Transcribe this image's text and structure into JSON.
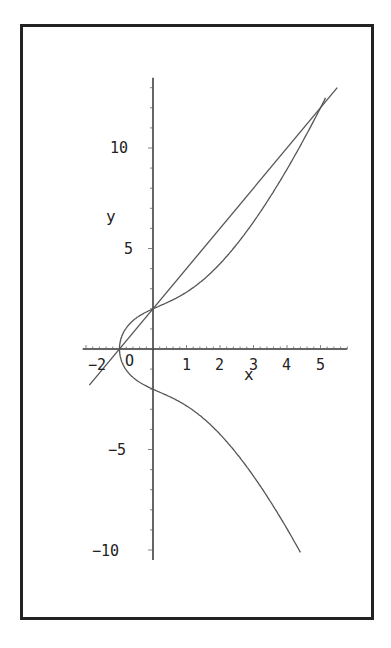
{
  "chart_data": {
    "type": "line",
    "title": "",
    "xlabel": "x",
    "ylabel": "y",
    "xlim": [
      -2.1,
      5.8
    ],
    "ylim": [
      -10.5,
      13.5
    ],
    "x_ticks": [
      -2,
      0,
      1,
      2,
      3,
      4,
      5
    ],
    "x_tick_labels": [
      "−2",
      "O",
      "1",
      "2",
      "3",
      "4",
      "5"
    ],
    "y_ticks": [
      -10,
      -5,
      5,
      10
    ],
    "y_tick_labels": [
      "−10",
      "−5",
      "5",
      "10"
    ],
    "grid": false,
    "legend": null,
    "series": [
      {
        "name": "curve y^2 = x^3 + 3x + 4",
        "kind": "implicit-curve",
        "x_range": [
          -1,
          5.15
        ],
        "upper_branch_end_x": 5.15,
        "lower_branch_end_x": 4.4,
        "color": "#555555"
      },
      {
        "name": "line y = 2x + 2",
        "kind": "line",
        "slope": 2,
        "intercept": 2,
        "x_range": [
          -1.9,
          5.5
        ],
        "color": "#555555"
      }
    ],
    "annotations": [
      {
        "text": "intersection",
        "x": -1,
        "y": 0
      },
      {
        "text": "intersection",
        "x": 0,
        "y": 2
      },
      {
        "text": "intersection",
        "x": 5,
        "y": 12
      }
    ]
  },
  "labels": {
    "x_axis": "x",
    "y_axis": "y",
    "origin": "O",
    "x_ticks": [
      "−2",
      "1",
      "2",
      "3",
      "4",
      "5"
    ],
    "y_ticks": [
      "10",
      "5",
      "−5",
      "−10"
    ]
  },
  "colors": {
    "frame": "#222222",
    "axes": "#333333",
    "curves": "#555555",
    "background": "#ffffff"
  }
}
